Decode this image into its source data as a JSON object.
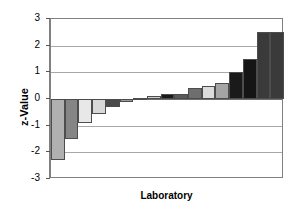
{
  "chart_data": {
    "type": "bar",
    "title": "",
    "subtitle": "",
    "xlabel": "Laboratory",
    "ylabel": "z-Value",
    "ylim": [
      -3,
      3
    ],
    "yticks": [
      3,
      2,
      1,
      0,
      -1,
      -2,
      -3
    ],
    "ytick_labels": [
      "3",
      "2",
      "1",
      "0",
      "-1",
      "-2",
      "-3"
    ],
    "xtick_labels": [],
    "grid": true,
    "grid_axis": "y",
    "legend": false,
    "legend_position": "none",
    "zero_reference_line": 0,
    "bar_count": 17,
    "categories": [
      "1",
      "2",
      "3",
      "4",
      "5",
      "6",
      "7",
      "8",
      "9",
      "10",
      "11",
      "12",
      "13",
      "14",
      "15",
      "16",
      "17"
    ],
    "values": [
      -2.3,
      -1.5,
      -0.9,
      -0.55,
      -0.3,
      -0.1,
      0.05,
      0.1,
      0.2,
      0.2,
      0.4,
      0.5,
      0.6,
      1.0,
      1.5,
      2.5,
      2.5
    ],
    "bar_colors": [
      "#b0b0b0",
      "#858585",
      "#e8e8e8",
      "#d8d8d8",
      "#4a4a4a",
      "#9a9a9a",
      "#8f8f8f",
      "#d0d0d0",
      "#1a1a1a",
      "#5a5a5a",
      "#6e6e6e",
      "#dcdcdc",
      "#a5a5a5",
      "#1a1a1a",
      "#151515",
      "#3a3a3a",
      "#3a3a3a"
    ],
    "bar_edge_color": "#4d4d4d",
    "axis_color": "#808080",
    "gridline_color": "#a8a8a8",
    "text_color": "#000000",
    "background_color": "#ffffff"
  },
  "labels": {
    "ylabel": "z-Value",
    "xlabel": "Laboratory"
  }
}
